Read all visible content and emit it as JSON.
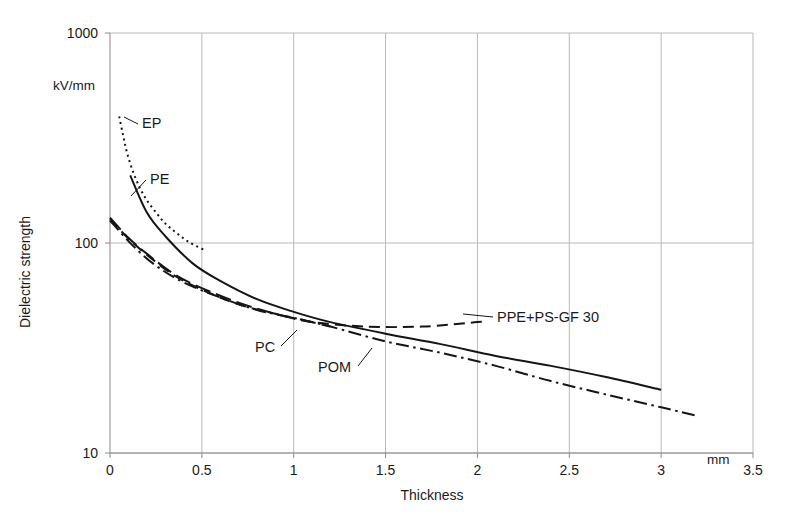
{
  "chart_data": {
    "type": "line",
    "title": "",
    "xlabel": "Thickness",
    "ylabel": "Dielectric strength",
    "x_unit": "mm",
    "y_unit": "kV/mm",
    "xlim": [
      0,
      3.5
    ],
    "ylim": [
      10,
      1000
    ],
    "yscale": "log",
    "xscale": "linear",
    "grid": "vertical gridlines at every 0.5 mm; horizontal gridlines at decades 10, 100, 1000",
    "legend": "inline curve labels with leader lines",
    "xticks": [
      "0",
      "0.5",
      "1",
      "1.5",
      "2",
      "2.5",
      "3",
      "3.5"
    ],
    "xtick_values": [
      0,
      0.5,
      1,
      1.5,
      2,
      2.5,
      3,
      3.5
    ],
    "yticks": [
      "10",
      "100",
      "1000"
    ],
    "ytick_values": [
      10,
      100,
      1000
    ],
    "series": [
      {
        "name": "EP",
        "style": "dotted",
        "label": "EP",
        "x": [
          0.05,
          0.07,
          0.09,
          0.12,
          0.16,
          0.2,
          0.25,
          0.3,
          0.36,
          0.43,
          0.52
        ],
        "values": [
          400,
          330,
          275,
          225,
          185,
          160,
          140,
          124,
          112,
          101,
          92
        ]
      },
      {
        "name": "PE",
        "style": "solid",
        "label": "PE",
        "x": [
          0.11,
          0.2,
          0.3,
          0.45,
          0.6,
          0.8,
          1.0,
          1.2,
          1.5,
          1.8,
          2.1,
          2.4,
          2.7,
          3.0
        ],
        "values": [
          210,
          140,
          108,
          80,
          66,
          54,
          47,
          42,
          37,
          33,
          29,
          26,
          23,
          20
        ]
      },
      {
        "name": "PPE+PS-GF 30",
        "style": "dashed",
        "label": "PPE+PS-GF 30",
        "x": [
          0.0,
          0.1,
          0.2,
          0.35,
          0.5,
          0.7,
          0.9,
          1.1,
          1.4,
          1.7,
          2.0,
          2.05
        ],
        "values": [
          130,
          105,
          88,
          70,
          60,
          51,
          46,
          42,
          40,
          40,
          42,
          42
        ]
      },
      {
        "name": "PC",
        "style": "long-dash",
        "label": "PC",
        "x": [
          0.0,
          0.1,
          0.2,
          0.35,
          0.5,
          0.7,
          0.9,
          1.05,
          1.2
        ],
        "values": [
          132,
          106,
          89,
          71,
          61,
          52,
          46,
          43,
          40
        ]
      },
      {
        "name": "POM",
        "style": "dash-dot",
        "label": "POM",
        "x": [
          0.0,
          0.12,
          0.25,
          0.4,
          0.6,
          0.8,
          1.0,
          1.2,
          1.5,
          1.8,
          2.1,
          2.4,
          2.7,
          3.0,
          3.2
        ],
        "values": [
          128,
          98,
          78,
          65,
          55,
          48,
          44,
          40,
          34,
          30,
          26,
          22,
          19,
          16.5,
          15
        ]
      }
    ]
  },
  "axis": {
    "y_unit_label": "kV/mm",
    "y_title": "Dielectric strength",
    "x_title": "Thickness",
    "x_unit_label": "mm"
  },
  "colors": {
    "curve": "#151515",
    "grid": "#b9b9b9",
    "axis": "#8a8a8a",
    "text": "#1a1a1a",
    "background": "#ffffff"
  }
}
